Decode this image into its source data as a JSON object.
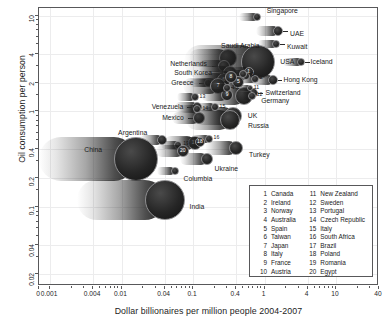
{
  "chart_data": {
    "type": "scatter",
    "title": "",
    "xlabel": "Dollar billionaires per million people 2004-2007",
    "ylabel": "Oil consumption per person",
    "xscale": "log",
    "yscale": "log",
    "xlim": [
      0.0007,
      40
    ],
    "ylim": [
      0.015,
      12
    ],
    "xticks": [
      "0",
      "0.001",
      "0.004",
      "0.01",
      "0.04",
      "0.1",
      "0.4",
      "1",
      "4",
      "10",
      "40"
    ],
    "xtick_values": [
      0.0007,
      0.001,
      0.004,
      0.01,
      0.04,
      0.1,
      0.4,
      1,
      4,
      10,
      40
    ],
    "yticks": [
      "10",
      "4",
      "2",
      "1",
      "0.4",
      "0.2",
      "0.1",
      "0.04",
      "0.02"
    ],
    "ytick_values": [
      10,
      4,
      2,
      1,
      0.4,
      0.2,
      0.1,
      0.04,
      0.02
    ],
    "grid": true,
    "legend_position": "bottom-right",
    "marker_style": "motion-blurred-bubbles",
    "points": [
      {
        "label": "Singapore",
        "x": 0.78,
        "y": 9.6,
        "size": 4
      },
      {
        "label": "UAE",
        "x": 1.55,
        "y": 6.9,
        "size": 5
      },
      {
        "label": "Kuwait",
        "x": 1.45,
        "y": 5.0,
        "size": 4
      },
      {
        "label": "Saudi Arabia",
        "x": 0.31,
        "y": 3.6,
        "size": 9
      },
      {
        "label": "Netherlands",
        "x": 0.27,
        "y": 2.95,
        "size": 6
      },
      {
        "label": "South Korea",
        "x": 0.33,
        "y": 2.5,
        "size": 7
      },
      {
        "label": "USA",
        "x": 0.82,
        "y": 3.3,
        "size": 17
      },
      {
        "label": "Iceland",
        "x": 3.2,
        "y": 3.3,
        "size": 4
      },
      {
        "label": "Hong Kong",
        "x": 1.3,
        "y": 2.15,
        "size": 5
      },
      {
        "label": "Greece",
        "x": 0.16,
        "y": 2.0,
        "size": 4
      },
      {
        "label": "Switzerland",
        "x": 0.7,
        "y": 1.55,
        "size": 5
      },
      {
        "label": "Germany",
        "x": 0.52,
        "y": 1.45,
        "size": 9
      },
      {
        "label": "Venezuela",
        "x": 0.115,
        "y": 1.1,
        "size": 5
      },
      {
        "label": "Mexico",
        "x": 0.12,
        "y": 0.85,
        "size": 6
      },
      {
        "label": "UK",
        "x": 0.36,
        "y": 0.9,
        "size": 9
      },
      {
        "label": "Russia",
        "x": 0.33,
        "y": 0.82,
        "size": 10
      },
      {
        "label": "Argentina",
        "x": 0.037,
        "y": 0.5,
        "size": 5
      },
      {
        "label": "China",
        "x": 0.016,
        "y": 0.32,
        "size": 22
      },
      {
        "label": "India",
        "x": 0.04,
        "y": 0.12,
        "size": 20
      },
      {
        "label": "Turkey",
        "x": 0.4,
        "y": 0.41,
        "size": 7
      },
      {
        "label": "Ukraine",
        "x": 0.155,
        "y": 0.32,
        "size": 6
      },
      {
        "label": "Columbia",
        "x": 0.055,
        "y": 0.24,
        "size": 4
      }
    ],
    "numbered_points": [
      {
        "n": 1,
        "label": "Canada",
        "x": 0.6,
        "y": 2.6,
        "size": 5
      },
      {
        "n": 2,
        "label": "Ireland",
        "x": 0.73,
        "y": 2.2,
        "size": 4
      },
      {
        "n": 3,
        "label": "Norway",
        "x": 0.55,
        "y": 2.35,
        "size": 4
      },
      {
        "n": 4,
        "label": "Australia",
        "x": 0.5,
        "y": 2.45,
        "size": 4
      },
      {
        "n": 5,
        "label": "Spain",
        "x": 0.43,
        "y": 2.05,
        "size": 6
      },
      {
        "n": 6,
        "label": "Taiwan",
        "x": 0.27,
        "y": 2.15,
        "size": 7
      },
      {
        "n": 7,
        "label": "Japan",
        "x": 0.225,
        "y": 1.85,
        "size": 8
      },
      {
        "n": 8,
        "label": "Italy",
        "x": 0.34,
        "y": 2.3,
        "size": 6
      },
      {
        "n": 9,
        "label": "France",
        "x": 0.3,
        "y": 1.5,
        "size": 6
      },
      {
        "n": 10,
        "label": "Austria",
        "x": 0.3,
        "y": 1.75,
        "size": 4
      },
      {
        "n": 11,
        "label": "New Zealand",
        "x": 0.62,
        "y": 1.75,
        "size": 3
      },
      {
        "n": 12,
        "label": "Sweden",
        "x": 0.66,
        "y": 1.45,
        "size": 4
      },
      {
        "n": 13,
        "label": "Portugal",
        "x": 0.105,
        "y": 1.4,
        "size": 4
      },
      {
        "n": 14,
        "label": "Czech Republic",
        "x": 0.115,
        "y": 1.05,
        "size": 4
      },
      {
        "n": 15,
        "label": "Italy",
        "x": 0.2,
        "y": 1.1,
        "size": 4
      },
      {
        "n": 16,
        "label": "South Africa",
        "x": 0.165,
        "y": 0.52,
        "size": 4
      },
      {
        "n": 17,
        "label": "Brazil",
        "x": 0.105,
        "y": 0.47,
        "size": 7
      },
      {
        "n": 18,
        "label": "Poland",
        "x": 0.125,
        "y": 0.48,
        "size": 5
      },
      {
        "n": 19,
        "label": "Romania",
        "x": 0.062,
        "y": 0.45,
        "size": 4
      },
      {
        "n": 20,
        "label": "Egypt",
        "x": 0.072,
        "y": 0.39,
        "size": 6
      }
    ]
  },
  "axis": {
    "x_title": "Dollar billionaires per million people 2004-2007",
    "y_title": "Oil consumption per person",
    "x_ticks": [
      "0",
      "0.001",
      "0.004",
      "0.01",
      "0.04",
      "0.1",
      "0.4",
      "1",
      "4",
      "10",
      "40"
    ],
    "y_ticks": [
      "10",
      "4",
      "2",
      "1",
      "0.4",
      "0.2",
      "0.1",
      "0.04",
      "0.02"
    ]
  },
  "labels": {
    "singapore": "Singapore",
    "uae": "UAE",
    "kuwait": "Kuwait",
    "saudi_arabia": "Saudi Arabia",
    "netherlands": "Netherlands",
    "south_korea": "South Korea",
    "usa": "USA",
    "iceland": "Iceland",
    "hong_kong": "Hong Kong",
    "greece": "Greece",
    "switzerland": "Switzerland",
    "germany": "Germany",
    "venezuela": "Venezuela",
    "mexico": "Mexico",
    "uk": "UK",
    "russia": "Russia",
    "argentina": "Argentina",
    "china": "China",
    "india": "India",
    "turkey": "Turkey",
    "ukraine": "Ukraine",
    "columbia": "Columbia"
  },
  "legend": {
    "left_column": [
      {
        "num": "1",
        "name": "Canada"
      },
      {
        "num": "2",
        "name": "Ireland"
      },
      {
        "num": "3",
        "name": "Norway"
      },
      {
        "num": "4",
        "name": "Australia"
      },
      {
        "num": "5",
        "name": "Spain"
      },
      {
        "num": "6",
        "name": "Taiwan"
      },
      {
        "num": "7",
        "name": "Japan"
      },
      {
        "num": "8",
        "name": "Italy"
      },
      {
        "num": "9",
        "name": "France"
      },
      {
        "num": "10",
        "name": "Austria"
      }
    ],
    "right_column": [
      {
        "num": "11",
        "name": "New Zealand"
      },
      {
        "num": "12",
        "name": "Sweden"
      },
      {
        "num": "13",
        "name": "Portugal"
      },
      {
        "num": "14",
        "name": "Czech Republic"
      },
      {
        "num": "15",
        "name": "Italy"
      },
      {
        "num": "16",
        "name": "South Africa"
      },
      {
        "num": "17",
        "name": "Brazil"
      },
      {
        "num": "18",
        "name": "Poland"
      },
      {
        "num": "19",
        "name": "Romania"
      },
      {
        "num": "20",
        "name": "Egypt"
      }
    ]
  },
  "colors": {
    "background": "#ffffff",
    "frame": "#58585a",
    "grid": "#ececed",
    "bubble": "#1b1b1b",
    "bubble_edge": "#8d8d8f",
    "text": "#1a1a1a"
  }
}
